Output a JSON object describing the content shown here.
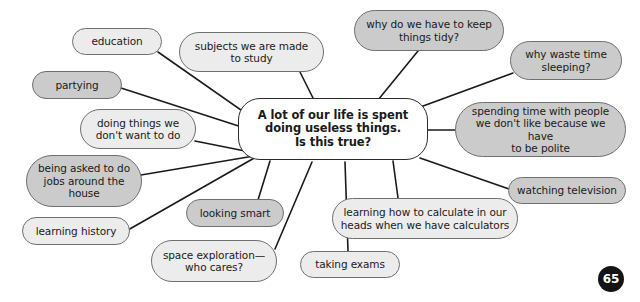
{
  "page": {
    "number": "65",
    "width": 640,
    "height": 302,
    "background": "#ffffff"
  },
  "colors": {
    "node_light_fill": "#ececec",
    "node_dark_fill": "#cbcbcb",
    "node_stroke": "#6f6f6f",
    "center_stroke": "#2b2b2b",
    "center_fill": "#ffffff",
    "edge_stroke": "#1a1a1a",
    "badge_fill": "#141414",
    "badge_text": "#ffffff"
  },
  "center": {
    "label": "A lot of our life is spent\ndoing useless things.\nIs this true?",
    "x": 238,
    "y": 98,
    "w": 190,
    "h": 62,
    "font_size": 11.5
  },
  "nodes": [
    {
      "id": "education",
      "label": "education",
      "shade": "light",
      "x": 72,
      "y": 28,
      "w": 90,
      "h": 27,
      "font_size": 10.5,
      "anchor_x": 158,
      "anchor_y": 52
    },
    {
      "id": "subjects-we-are-made-to-study",
      "label": "subjects we are made\nto study",
      "shade": "light",
      "x": 179,
      "y": 32,
      "w": 145,
      "h": 40,
      "font_size": 10.5,
      "anchor_x": 300,
      "anchor_y": 72
    },
    {
      "id": "why-do-we-have-to-keep-things-tidy",
      "label": "why do we have to keep\nthings tidy?",
      "shade": "dark",
      "x": 354,
      "y": 10,
      "w": 150,
      "h": 41,
      "font_size": 10.5,
      "anchor_x": 418,
      "anchor_y": 51
    },
    {
      "id": "why-waste-time-sleeping",
      "label": "why waste time\nsleeping?",
      "shade": "dark",
      "x": 510,
      "y": 41,
      "w": 112,
      "h": 39,
      "font_size": 10.5,
      "anchor_x": 513,
      "anchor_y": 73
    },
    {
      "id": "partying",
      "label": "partying",
      "shade": "dark",
      "x": 32,
      "y": 71,
      "w": 90,
      "h": 28,
      "font_size": 10.5,
      "anchor_x": 121,
      "anchor_y": 88
    },
    {
      "id": "doing-things-we-dont-want-to-do",
      "label": "doing things we\ndon't want to do",
      "shade": "light",
      "x": 80,
      "y": 109,
      "w": 116,
      "h": 40,
      "font_size": 10.5,
      "anchor_x": 195,
      "anchor_y": 141
    },
    {
      "id": "spending-time-with-people",
      "label": "spending time with people\nwe don't like because we have\nto be polite",
      "shade": "dark",
      "x": 455,
      "y": 102,
      "w": 171,
      "h": 55,
      "font_size": 10.5,
      "anchor_x": 455,
      "anchor_y": 130
    },
    {
      "id": "being-asked-to-do-jobs-around-the-house",
      "label": "being asked to do\njobs around the\nhouse",
      "shade": "dark",
      "x": 26,
      "y": 155,
      "w": 116,
      "h": 52,
      "font_size": 10.5,
      "anchor_x": 141,
      "anchor_y": 175
    },
    {
      "id": "watching-television",
      "label": "watching television",
      "shade": "dark",
      "x": 508,
      "y": 177,
      "w": 118,
      "h": 27,
      "font_size": 10.5,
      "anchor_x": 509,
      "anchor_y": 189
    },
    {
      "id": "looking-smart",
      "label": "looking smart",
      "shade": "dark",
      "x": 186,
      "y": 199,
      "w": 98,
      "h": 28,
      "font_size": 10.5,
      "anchor_x": 258,
      "anchor_y": 200
    },
    {
      "id": "learning-how-to-calculate",
      "label": "learning how to calculate in our\nheads when we have calculators",
      "shade": "light",
      "x": 332,
      "y": 198,
      "w": 186,
      "h": 41,
      "font_size": 10.5,
      "anchor_x": 398,
      "anchor_y": 198
    },
    {
      "id": "learning-history",
      "label": "learning history",
      "shade": "light",
      "x": 22,
      "y": 217,
      "w": 108,
      "h": 28,
      "font_size": 10.5,
      "anchor_x": 128,
      "anchor_y": 230
    },
    {
      "id": "space-exploration-who-cares",
      "label": "space exploration—\nwho cares?",
      "shade": "light",
      "x": 151,
      "y": 240,
      "w": 126,
      "h": 42,
      "font_size": 10.5,
      "anchor_x": 275,
      "anchor_y": 249
    },
    {
      "id": "taking-exams",
      "label": "taking exams",
      "shade": "light",
      "x": 300,
      "y": 251,
      "w": 100,
      "h": 27,
      "font_size": 10.5,
      "anchor_x": 348,
      "anchor_y": 251
    }
  ],
  "edges": [
    {
      "from": "education",
      "x1": 158,
      "y1": 52,
      "x2": 258,
      "y2": 122
    },
    {
      "from": "subjects-we-are-made-to-study",
      "x1": 300,
      "y1": 72,
      "x2": 313,
      "y2": 98
    },
    {
      "from": "why-do-we-have-to-keep-things-tidy",
      "x1": 418,
      "y1": 51,
      "x2": 378,
      "y2": 100
    },
    {
      "from": "why-waste-time-sleeping",
      "x1": 513,
      "y1": 73,
      "x2": 404,
      "y2": 113
    },
    {
      "from": "partying",
      "x1": 121,
      "y1": 88,
      "x2": 254,
      "y2": 131
    },
    {
      "from": "doing-things-we-dont-want-to-do",
      "x1": 195,
      "y1": 141,
      "x2": 250,
      "y2": 152
    },
    {
      "from": "spending-time-with-people",
      "x1": 455,
      "y1": 130,
      "x2": 428,
      "y2": 130
    },
    {
      "from": "being-asked-to-do-jobs-around-the-house",
      "x1": 141,
      "y1": 175,
      "x2": 254,
      "y2": 156
    },
    {
      "from": "watching-television",
      "x1": 509,
      "y1": 189,
      "x2": 420,
      "y2": 158
    },
    {
      "from": "looking-smart",
      "x1": 258,
      "y1": 200,
      "x2": 270,
      "y2": 161
    },
    {
      "from": "learning-how-to-calculate",
      "x1": 398,
      "y1": 198,
      "x2": 393,
      "y2": 161
    },
    {
      "from": "learning-history",
      "x1": 128,
      "y1": 230,
      "x2": 256,
      "y2": 157
    },
    {
      "from": "space-exploration-who-cares",
      "x1": 275,
      "y1": 249,
      "x2": 312,
      "y2": 162
    },
    {
      "from": "taking-exams",
      "x1": 348,
      "y1": 251,
      "x2": 345,
      "y2": 162
    }
  ],
  "badge": {
    "x": 598,
    "y": 266
  }
}
